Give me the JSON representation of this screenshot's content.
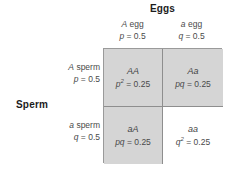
{
  "diagram": {
    "title_top": "Eggs",
    "title_left": "Sperm",
    "columns": [
      {
        "allele": "A",
        "gamete": " egg",
        "freq_symbol": "p",
        "freq_value": " = 0.5"
      },
      {
        "allele": "a",
        "gamete": " egg",
        "freq_symbol": "q",
        "freq_value": " = 0.5"
      }
    ],
    "rows": [
      {
        "allele": "A",
        "gamete": " sperm",
        "freq_symbol": "p",
        "freq_value": " = 0.5"
      },
      {
        "allele": "a",
        "gamete": " sperm",
        "freq_symbol": "q",
        "freq_value": " = 0.5"
      }
    ],
    "cells": [
      {
        "genotype": "AA",
        "prob_symbol": "p",
        "prob_exponent": "2",
        "prob_value": " = 0.25",
        "shaded": true
      },
      {
        "genotype": "Aa",
        "prob_symbol": "pq",
        "prob_exponent": "",
        "prob_value": " = 0.25",
        "shaded": true
      },
      {
        "genotype": "aA",
        "prob_symbol": "pq",
        "prob_exponent": "",
        "prob_value": " = 0.25",
        "shaded": true
      },
      {
        "genotype": "aa",
        "prob_symbol": "q",
        "prob_exponent": "2",
        "prob_value": " = 0.25",
        "shaded": false
      }
    ],
    "colors": {
      "shaded_cell": "#d5d5d5",
      "plain_cell": "#ffffff",
      "border": "#8e8e8e",
      "text": "#4a4a4a",
      "heading_text": "#1c1c1c"
    }
  }
}
